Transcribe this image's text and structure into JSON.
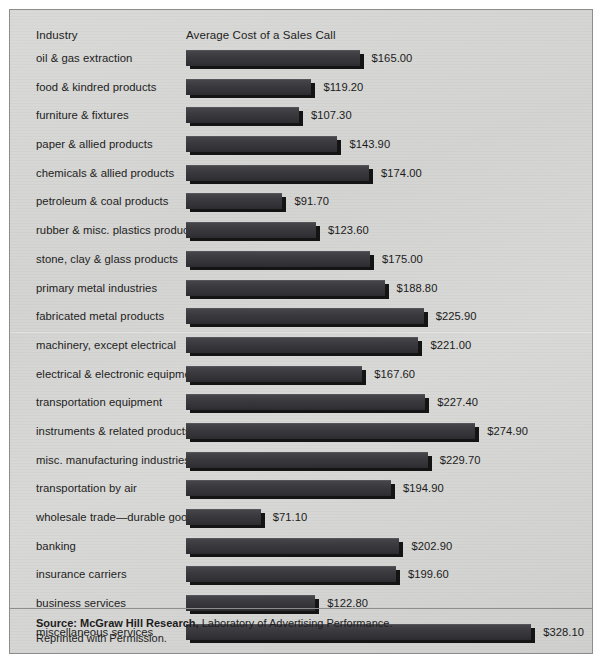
{
  "header": {
    "industry_label": "Industry",
    "metric_label": "Average Cost of a Sales Call"
  },
  "source": {
    "line1_bold": "Source: McGraw Hill Research,",
    "line1_rest": " Laboratory of Advertising Performance.",
    "line2": "Reprinted with Permission."
  },
  "colors": {
    "panel_background": "#d6d6d4",
    "panel_border": "#8d8d8b",
    "bar_face": "#3a3a3e",
    "bar_shadow": "#141414",
    "text": "#1d1d1d"
  },
  "chart_data": {
    "type": "bar",
    "orientation": "horizontal",
    "title": "Average Cost of a Sales Call",
    "xlabel": "Average Cost of a Sales Call",
    "ylabel": "Industry",
    "grid": false,
    "legend": null,
    "xlim": [
      0,
      340
    ],
    "value_prefix": "$",
    "categories": [
      "oil & gas extraction",
      "food & kindred products",
      "furniture & fixtures",
      "paper & allied products",
      "chemicals & allied products",
      "petroleum & coal products",
      "rubber & misc. plastics products",
      "stone, clay & glass products",
      "primary metal industries",
      "fabricated metal products",
      "machinery, except electrical",
      "electrical & electronic equipment",
      "transportation equipment",
      "instruments & related products",
      "misc. manufacturing industries",
      "transportation by air",
      "wholesale trade—durable goods",
      "banking",
      "insurance carriers",
      "business services",
      "miscellaneous services"
    ],
    "values": [
      165.0,
      119.2,
      107.3,
      143.9,
      174.0,
      91.7,
      123.6,
      175.0,
      188.8,
      225.9,
      221.0,
      167.6,
      227.4,
      274.9,
      229.7,
      194.9,
      71.1,
      202.9,
      199.6,
      122.8,
      328.1
    ],
    "value_labels": [
      "$165.00",
      "$119.20",
      "$107.30",
      "$143.90",
      "$174.00",
      "$91.70",
      "$123.60",
      "$175.00",
      "$188.80",
      "$225.90",
      "$221.00",
      "$167.60",
      "$227.40",
      "$274.90",
      "$229.70",
      "$194.90",
      "$71.10",
      "$202.90",
      "$199.60",
      "$122.80",
      "$328.10"
    ]
  }
}
